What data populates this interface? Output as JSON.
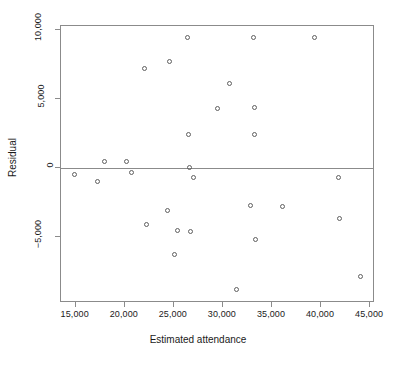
{
  "chart_data": {
    "type": "scatter",
    "title": "",
    "xlabel": "Estimated attendance",
    "ylabel": "Residual",
    "xlim": [
      13500,
      45500
    ],
    "ylim": [
      -9800,
      10300
    ],
    "grid": false,
    "legend": null,
    "xticks": [
      15000,
      20000,
      25000,
      30000,
      35000,
      40000,
      45000
    ],
    "xticklabels": [
      "15,000",
      "20,000",
      "25,000",
      "30,000",
      "35,000",
      "40,000",
      "45,000"
    ],
    "yticks": [
      -5000,
      0,
      5000,
      10000
    ],
    "yticklabels": [
      "−5,000",
      "0",
      "5,000",
      "10,000"
    ],
    "reference_lines": [
      {
        "axis": "y",
        "value": 0,
        "color": "#8b8b8b"
      }
    ],
    "marker": {
      "shape": "circle",
      "filled": false,
      "edge_color": "#5f5f5f",
      "size": 5
    },
    "points": [
      {
        "x": 14900,
        "y": -450
      },
      {
        "x": 17200,
        "y": -1000
      },
      {
        "x": 17900,
        "y": 500
      },
      {
        "x": 20200,
        "y": 500
      },
      {
        "x": 20700,
        "y": -300
      },
      {
        "x": 22000,
        "y": 7200
      },
      {
        "x": 22200,
        "y": -4100
      },
      {
        "x": 24300,
        "y": -3100
      },
      {
        "x": 24600,
        "y": 7700
      },
      {
        "x": 25100,
        "y": -6300
      },
      {
        "x": 25400,
        "y": -4500
      },
      {
        "x": 26400,
        "y": 9500
      },
      {
        "x": 26500,
        "y": 2400
      },
      {
        "x": 26600,
        "y": 0
      },
      {
        "x": 26700,
        "y": -4600
      },
      {
        "x": 27000,
        "y": -700
      },
      {
        "x": 29400,
        "y": 4300
      },
      {
        "x": 30700,
        "y": 6100
      },
      {
        "x": 31400,
        "y": -8800
      },
      {
        "x": 32800,
        "y": -2700
      },
      {
        "x": 33100,
        "y": 9500
      },
      {
        "x": 33200,
        "y": 4400
      },
      {
        "x": 33200,
        "y": 2400
      },
      {
        "x": 33300,
        "y": -5200
      },
      {
        "x": 36100,
        "y": -2800
      },
      {
        "x": 39300,
        "y": 9500
      },
      {
        "x": 41800,
        "y": -700
      },
      {
        "x": 41900,
        "y": -3700
      },
      {
        "x": 44000,
        "y": -7900
      }
    ]
  }
}
